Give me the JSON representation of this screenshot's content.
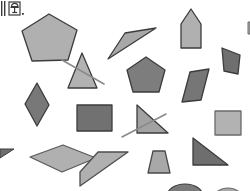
{
  "canvas": {
    "width": 250,
    "height": 191,
    "background": "#ffffff",
    "title": "geometric-shapes-scatter"
  },
  "corner_mark": {
    "name": "lamp-glyph-icon",
    "label": "\u0001\u0001",
    "color": "#3a3a3a",
    "description": "small dark glyph with two vertical bars and a period at canvas top-left"
  },
  "palette": {
    "light_gray": "#b4b4b4",
    "mid_gray": "#a0a0a0",
    "medium_gray": "#8e8e8e",
    "dark_gray": "#767676",
    "darker_gray": "#6e6e6e",
    "stroke": "#3c3c3c",
    "stroke_light": "#555555",
    "line_overlay": "#8a8a8a"
  },
  "shapes": [
    {
      "id": 1,
      "name": "pentagon-light-top-left",
      "type": "pentagon",
      "fill": "#b0b0b0",
      "stroke": "#3c3c3c",
      "points": "49,14 77,30 68,60 32,61 22,31"
    },
    {
      "id": 2,
      "name": "triangle-right-top-center",
      "type": "right-triangle",
      "fill": "#a8a8a8",
      "stroke": "#3c3c3c",
      "points": "125,33 156,28 108,59"
    },
    {
      "id": 3,
      "name": "pentagon-house-top-right",
      "type": "pentagon",
      "fill": "#b0b0b0",
      "stroke": "#3c3c3c",
      "points": "191,9 201,24 201,48 181,48 181,24"
    },
    {
      "id": 4,
      "name": "triangle-crossed-left",
      "type": "triangle",
      "fill": "#b2b2b2",
      "stroke": "#3c3c3c",
      "points": "82,53 97,88 68,88"
    },
    {
      "id": 5,
      "name": "pentagon-dark-center",
      "type": "pentagon",
      "fill": "#7d7d7d",
      "stroke": "#3c3c3c",
      "points": "146,57 165,70 159,92 133,92 127,70"
    },
    {
      "id": 6,
      "name": "quadrilateral-dark-right",
      "type": "quadrilateral",
      "fill": "#6f6f6f",
      "stroke": "#3c3c3c",
      "points": "222,48 240,55 238,74 224,71"
    },
    {
      "id": 7,
      "name": "parallelogram-dark-right",
      "type": "parallelogram",
      "fill": "#767676",
      "stroke": "#3c3c3c",
      "points": "190,72 209,69 201,100 182,102"
    },
    {
      "id": 8,
      "name": "rhombus-dark-left",
      "type": "rhombus",
      "fill": "#787878",
      "stroke": "#3c3c3c",
      "points": "37,83 49,105 37,126 25,104"
    },
    {
      "id": 9,
      "name": "square-dark-center-left",
      "type": "square",
      "fill": "#717171",
      "stroke": "#3c3c3c",
      "points": "77,105 112,105 112,131 77,131"
    },
    {
      "id": 10,
      "name": "triangle-crossed-center",
      "type": "right-triangle",
      "fill": "#a2a2a2",
      "stroke": "#3c3c3c",
      "points": "137,105 168,133 137,133"
    },
    {
      "id": 11,
      "name": "square-light-right",
      "type": "square",
      "fill": "#b2b2b2",
      "stroke": "#6a6a6a",
      "points": "215,111 241,111 241,135 215,135"
    },
    {
      "id": 12,
      "name": "parallelogram-light-bottom-left",
      "type": "parallelogram",
      "fill": "#b0b0b0",
      "stroke": "#5a5a5a",
      "points": "30,157 63,145 96,158 62,172"
    },
    {
      "id": 13,
      "name": "quadrilateral-light-bottom-center",
      "type": "quadrilateral",
      "fill": "#b0b0b0",
      "stroke": "#4e4e4e",
      "points": "80,172 98,152 128,152 80,186"
    },
    {
      "id": 14,
      "name": "trapezoid-light-bottom",
      "type": "trapezoid",
      "fill": "#a8a8a8",
      "stroke": "#4a4a4a",
      "points": "153,151 165,151 170,173 148,173"
    },
    {
      "id": 15,
      "name": "triangle-dark-bottom-right",
      "type": "right-triangle",
      "fill": "#6e6e6e",
      "stroke": "#3c3c3c",
      "points": "193,138 228,165 193,165"
    },
    {
      "id": 16,
      "name": "ellipse-dark-bottom-edge",
      "type": "ellipse",
      "fill": "#7a7a7a",
      "stroke": "#3c3c3c",
      "cx": 185,
      "cy": 196,
      "rx": 18,
      "ry": 12
    },
    {
      "id": 17,
      "name": "ellipse-light-bottom-edge",
      "type": "ellipse",
      "fill": "#a8a8a8",
      "stroke": "#6a6a6a",
      "cx": 228,
      "cy": 198,
      "rx": 14,
      "ry": 10
    }
  ],
  "strike_lines": [
    {
      "name": "strike-line-left-triangle",
      "x1": 62,
      "y1": 60,
      "x2": 104,
      "y2": 84,
      "color": "#8a8a8a",
      "width": 1.6
    },
    {
      "name": "strike-line-center-triangle",
      "x1": 122,
      "y1": 137,
      "x2": 166,
      "y2": 114,
      "color": "#8a8a8a",
      "width": 1.6
    }
  ],
  "edge_fragments": [
    {
      "name": "fragment-arrow-left-edge",
      "fill": "#6e6e6e",
      "stroke": "#3c3c3c",
      "points": "0,149 14,149 0,158"
    },
    {
      "name": "fragment-right-edge-top",
      "fill": "#b0b0b0",
      "stroke": "#6a6a6a",
      "points": "248,22 250,22 250,34 248,34"
    }
  ]
}
